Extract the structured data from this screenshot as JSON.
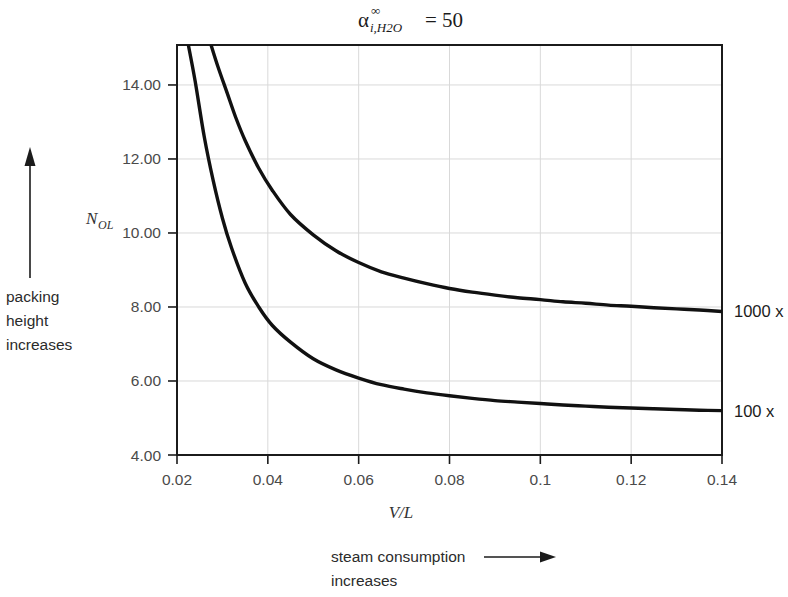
{
  "chart_data": {
    "type": "line",
    "title_parts": {
      "symbol": "α",
      "superscript": "∞",
      "subscript": "i,H2O",
      "equals_value": "= 50"
    },
    "xlabel": "V/L",
    "ylabel": "NOL",
    "ylabel_parts": {
      "base": "N",
      "subscript": "OL"
    },
    "xlim": [
      0.02,
      0.14
    ],
    "ylim": [
      4.0,
      15.08
    ],
    "xticks": [
      0.02,
      0.04,
      0.06,
      0.08,
      0.1,
      0.12,
      0.14
    ],
    "xtick_labels": [
      "0.02",
      "0.04",
      "0.06",
      "0.08",
      "0.1",
      "0.12",
      "0.14"
    ],
    "yticks": [
      4.0,
      6.0,
      8.0,
      10.0,
      12.0,
      14.0
    ],
    "ytick_labels": [
      "4.00",
      "6.00",
      "8.00",
      "10.00",
      "12.00",
      "14.00"
    ],
    "grid": true,
    "legend_position": "right-of-curve-ends",
    "series": [
      {
        "name": "1000 x",
        "label": "1000 x",
        "color": "#111111",
        "x": [
          0.0275,
          0.029,
          0.031,
          0.033,
          0.035,
          0.038,
          0.041,
          0.045,
          0.05,
          0.055,
          0.06,
          0.065,
          0.07,
          0.075,
          0.08,
          0.085,
          0.09,
          0.095,
          0.1,
          0.105,
          0.11,
          0.115,
          0.12,
          0.125,
          0.13,
          0.135,
          0.14
        ],
        "y": [
          15.08,
          14.5,
          13.8,
          13.1,
          12.5,
          11.75,
          11.15,
          10.5,
          9.95,
          9.52,
          9.2,
          8.95,
          8.78,
          8.63,
          8.5,
          8.4,
          8.32,
          8.25,
          8.2,
          8.14,
          8.1,
          8.05,
          8.02,
          7.98,
          7.95,
          7.92,
          7.88
        ]
      },
      {
        "name": "100 x",
        "label": "100 x",
        "color": "#111111",
        "x": [
          0.0225,
          0.024,
          0.026,
          0.028,
          0.03,
          0.032,
          0.035,
          0.038,
          0.041,
          0.045,
          0.05,
          0.055,
          0.06,
          0.065,
          0.07,
          0.075,
          0.08,
          0.085,
          0.09,
          0.095,
          0.1,
          0.105,
          0.11,
          0.115,
          0.12,
          0.125,
          0.13,
          0.135,
          0.14
        ],
        "y": [
          15.08,
          14.1,
          12.6,
          11.4,
          10.4,
          9.6,
          8.65,
          8.0,
          7.5,
          7.05,
          6.6,
          6.3,
          6.08,
          5.9,
          5.78,
          5.68,
          5.6,
          5.53,
          5.47,
          5.43,
          5.39,
          5.35,
          5.32,
          5.29,
          5.27,
          5.25,
          5.23,
          5.21,
          5.2
        ]
      }
    ],
    "annotations": {
      "left_arrow_label": [
        "packing",
        "height",
        "increases"
      ],
      "left_arrow_direction": "up",
      "bottom_arrow_label": [
        "steam consumption",
        "increases"
      ],
      "bottom_arrow_direction": "right"
    }
  }
}
